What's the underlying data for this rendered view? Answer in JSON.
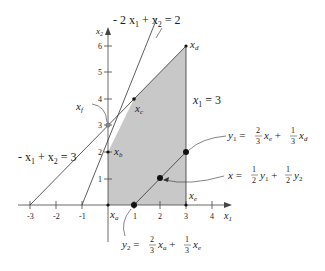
{
  "axes": {
    "x_label": "x",
    "x_label_sub": "1",
    "y_label": "x",
    "y_label_sub": "2",
    "x_ticks": [
      "-3",
      "-2",
      "-1",
      "1",
      "2",
      "3",
      "4"
    ],
    "y_ticks": [
      "1",
      "2",
      "3",
      "4",
      "5",
      "6"
    ]
  },
  "lines": {
    "line1": {
      "lhs_a": "- 2 x",
      "sub1": "1",
      "mid": " + x",
      "sub2": "2",
      "rhs": " = 2"
    },
    "line2": {
      "lhs_a": "- x",
      "sub1": "1",
      "mid": " + x",
      "sub2": "2",
      "rhs": " = 3"
    },
    "line3": {
      "lhs": "x",
      "sub": "1",
      "rhs": " = 3"
    }
  },
  "points": {
    "xa": {
      "name": "x",
      "sub": "a"
    },
    "xb": {
      "name": "x",
      "sub": "b"
    },
    "xc": {
      "name": "x",
      "sub": "c"
    },
    "xd": {
      "name": "x",
      "sub": "d"
    },
    "xe": {
      "name": "x",
      "sub": "e"
    },
    "xf": {
      "name": "x",
      "sub": "f"
    }
  },
  "annotations": {
    "y1": {
      "lhs": "y",
      "lhs_sub": "1",
      "eq": " = ",
      "frac1_num": "2",
      "frac1_den": "3",
      "t1": "x",
      "t1_sub": "e",
      "plus": " + ",
      "frac2_num": "1",
      "frac2_den": "3",
      "t2": "x",
      "t2_sub": "d"
    },
    "y2": {
      "lhs": "y",
      "lhs_sub": "2",
      "eq": " = ",
      "frac1_num": "2",
      "frac1_den": "3",
      "t1": "x",
      "t1_sub": "a",
      "plus": " + ",
      "frac2_num": "1",
      "frac2_den": "3",
      "t2": "x",
      "t2_sub": "e"
    },
    "x": {
      "lhs": "x",
      "eq": " = ",
      "frac1_num": "1",
      "frac1_den": "2",
      "t1": "y",
      "t1_sub": "1",
      "plus": " + ",
      "frac2_num": "1",
      "frac2_den": "2",
      "t2": "y",
      "t2_sub": "2"
    }
  },
  "colors": {
    "region": "#c8c8c8",
    "line": "#333333"
  }
}
